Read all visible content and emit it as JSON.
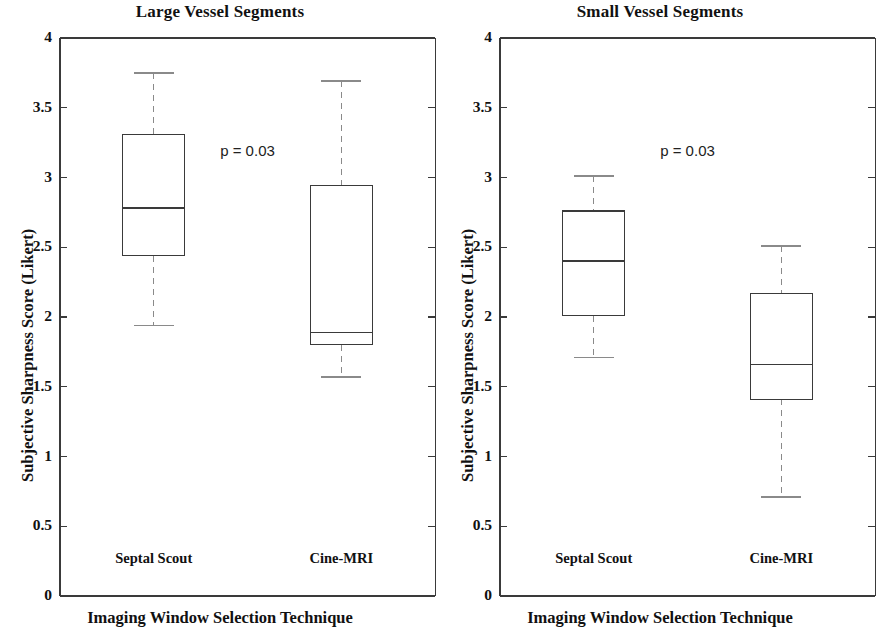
{
  "figure": {
    "width": 880,
    "height": 632,
    "background": "#ffffff",
    "line_color": "#3a3a3a",
    "whisker_color": "#8a8a8a",
    "text_color": "#111111"
  },
  "chart_data": [
    {
      "type": "box",
      "panel_index": 0,
      "title": "Large Vessel Segments",
      "xlabel": "Imaging Window Selection Technique",
      "ylabel": "Subjective Sharpness Score (Likert)",
      "ylim": [
        0,
        4
      ],
      "yticks": [
        0,
        0.5,
        1,
        1.5,
        2,
        2.5,
        3,
        3.5,
        4
      ],
      "ytick_labels": [
        "0",
        "0.5",
        "1",
        "1.5",
        "2",
        "2.5",
        "3",
        "3.5",
        "4"
      ],
      "grid": false,
      "legend": "none",
      "annotations": [
        {
          "text": "p = 0.03",
          "x_category_fraction": 0.5,
          "y": 3.18
        }
      ],
      "categories": [
        "Septal Scout",
        "Cine-MRI"
      ],
      "boxes": [
        {
          "category": "Septal Scout",
          "min": 1.94,
          "q1": 2.44,
          "median": 2.78,
          "q3": 3.31,
          "max": 3.75
        },
        {
          "category": "Cine-MRI",
          "min": 1.57,
          "q1": 1.8,
          "median": 1.89,
          "q3": 2.94,
          "max": 3.69
        }
      ]
    },
    {
      "type": "box",
      "panel_index": 1,
      "title": "Small Vessel Segments",
      "xlabel": "Imaging Window Selection Technique",
      "ylabel": "Subjective Sharpness Score (Likert)",
      "ylim": [
        0,
        4
      ],
      "yticks": [
        0,
        0.5,
        1,
        1.5,
        2,
        2.5,
        3,
        3.5,
        4
      ],
      "ytick_labels": [
        "0",
        "0.5",
        "1",
        "1.5",
        "2",
        "2.5",
        "3",
        "3.5",
        "4"
      ],
      "grid": false,
      "legend": "none",
      "annotations": [
        {
          "text": "p = 0.03",
          "x_category_fraction": 0.5,
          "y": 3.18
        }
      ],
      "categories": [
        "Septal Scout",
        "Cine-MRI"
      ],
      "boxes": [
        {
          "category": "Septal Scout",
          "min": 1.71,
          "q1": 2.01,
          "median": 2.4,
          "q3": 2.76,
          "max": 3.01
        },
        {
          "category": "Cine-MRI",
          "min": 0.71,
          "q1": 1.41,
          "median": 1.66,
          "q3": 2.17,
          "max": 2.51
        }
      ]
    }
  ]
}
